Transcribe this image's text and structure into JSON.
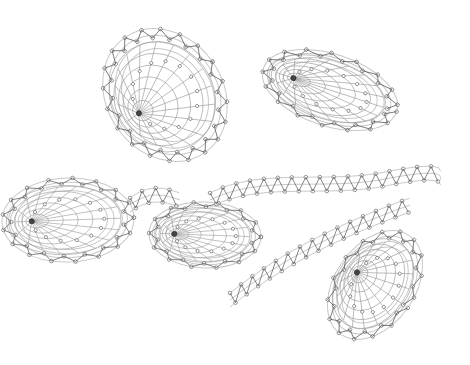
{
  "diagram": {
    "type": "bobbin lace pricking / working diagram",
    "background": "#ffffff",
    "colors": {
      "outline": "#c8c8c8",
      "grid": "#9a9a9a",
      "zigzag": "#555555",
      "pins": "#6a6a6a"
    },
    "elements": [
      {
        "name": "leaf-top-left",
        "cx": 165,
        "cy": 95,
        "rx": 58,
        "ry": 70,
        "rot": -35,
        "center": [
          145,
          65
        ]
      },
      {
        "name": "leaf-top-right",
        "cx": 330,
        "cy": 90,
        "rx": 70,
        "ry": 36,
        "rot": 18,
        "center": [
          265,
          108
        ]
      },
      {
        "name": "leaf-left",
        "cx": 68,
        "cy": 220,
        "rx": 66,
        "ry": 42,
        "rot": -2,
        "center": [
          30,
          227
        ]
      },
      {
        "name": "leaf-middle",
        "cx": 205,
        "cy": 235,
        "rx": 56,
        "ry": 33,
        "rot": 2,
        "center": [
          185,
          228
        ]
      },
      {
        "name": "leaf-bottom-right",
        "cx": 375,
        "cy": 285,
        "rx": 40,
        "ry": 60,
        "rot": 35,
        "center": [
          370,
          305
        ]
      }
    ],
    "stems": [
      {
        "name": "main-stem-band",
        "path": "M210,200 C260,175 320,190 380,180 C420,172 445,170 440,180"
      },
      {
        "name": "lower-band",
        "path": "M230,300 C280,260 340,230 410,205"
      },
      {
        "name": "connector-left-middle",
        "path": "M130,205 C150,190 165,195 180,200"
      }
    ]
  }
}
